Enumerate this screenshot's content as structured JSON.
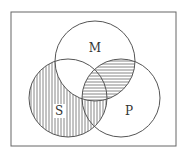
{
  "diagram": {
    "type": "venn",
    "frame": {
      "x": 11,
      "y": 12,
      "w": 165,
      "h": 134
    },
    "circles": [
      {
        "id": "M",
        "label": "M",
        "cx": 95,
        "cy": 61,
        "r": 40,
        "label_x": 95,
        "label_y": 52
      },
      {
        "id": "S",
        "label": "S",
        "cx": 68,
        "cy": 98,
        "r": 39,
        "label_x": 59,
        "label_y": 115
      },
      {
        "id": "P",
        "label": "P",
        "cx": 121,
        "cy": 98,
        "r": 39,
        "label_x": 129,
        "label_y": 115
      }
    ],
    "shading": [
      {
        "region": "S minus M",
        "pattern": "vertical-lines"
      },
      {
        "region": "M intersect P",
        "pattern": "horizontal-lines"
      }
    ],
    "colors": {
      "stroke": "#555555",
      "hatch": "#666666",
      "background": "#ffffff"
    }
  }
}
